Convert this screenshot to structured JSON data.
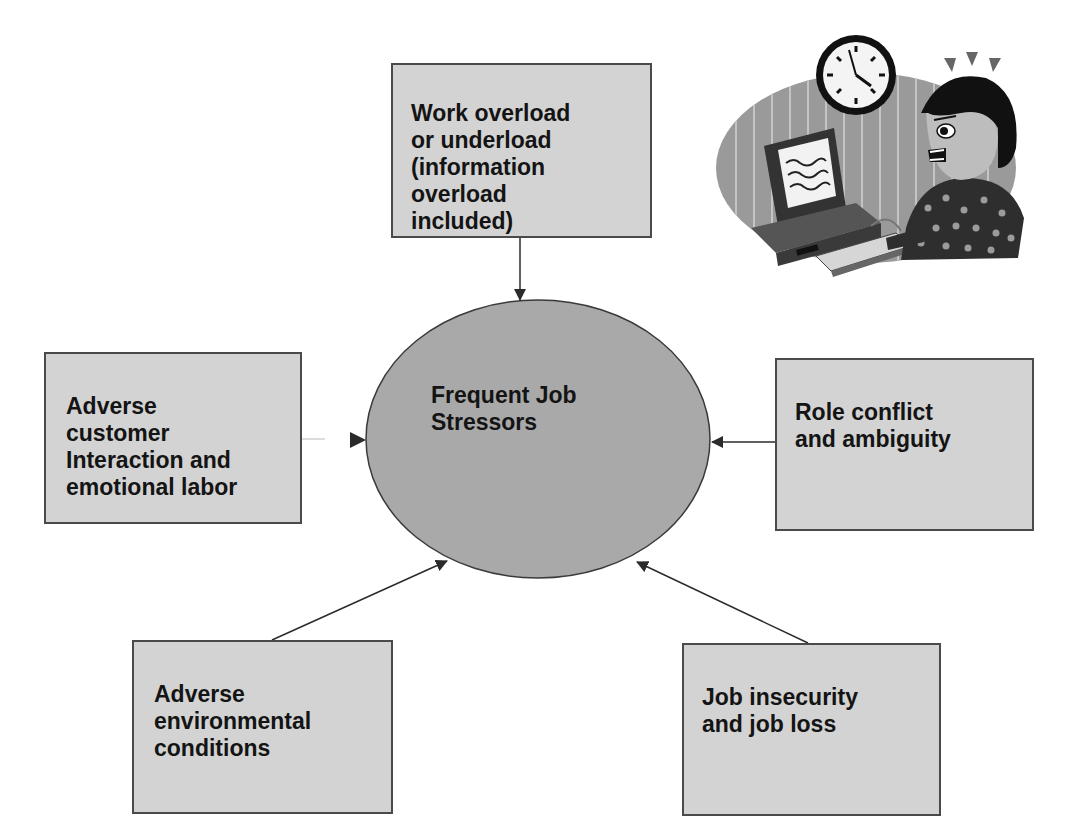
{
  "diagram": {
    "type": "hub-and-spoke",
    "center": {
      "label": "Frequent Job\nStressors"
    },
    "stressors": [
      {
        "id": "top",
        "label": "Work overload\nor underload\n(information\noverload\nincluded)",
        "position": "top"
      },
      {
        "id": "left",
        "label": "Adverse\ncustomer\nInteraction and\nemotional labor",
        "position": "left"
      },
      {
        "id": "right",
        "label": "Role conflict\nand ambiguity",
        "position": "right"
      },
      {
        "id": "bottom-left",
        "label": "Adverse\nenvironmental\nconditions",
        "position": "bottom-left"
      },
      {
        "id": "bottom-right",
        "label": "Job insecurity\nand job loss",
        "position": "bottom-right"
      }
    ],
    "arrow_direction": "toward-center"
  },
  "illustration": {
    "subject": "stressed-office-worker-at-computer",
    "elements": [
      "wall-clock",
      "computer-monitor",
      "keyboard",
      "stressed-person"
    ]
  },
  "colors": {
    "box_fill": "#d3d3d3",
    "center_fill": "#a9a9a9",
    "stroke": "#2b2b2b",
    "text": "#141414"
  }
}
